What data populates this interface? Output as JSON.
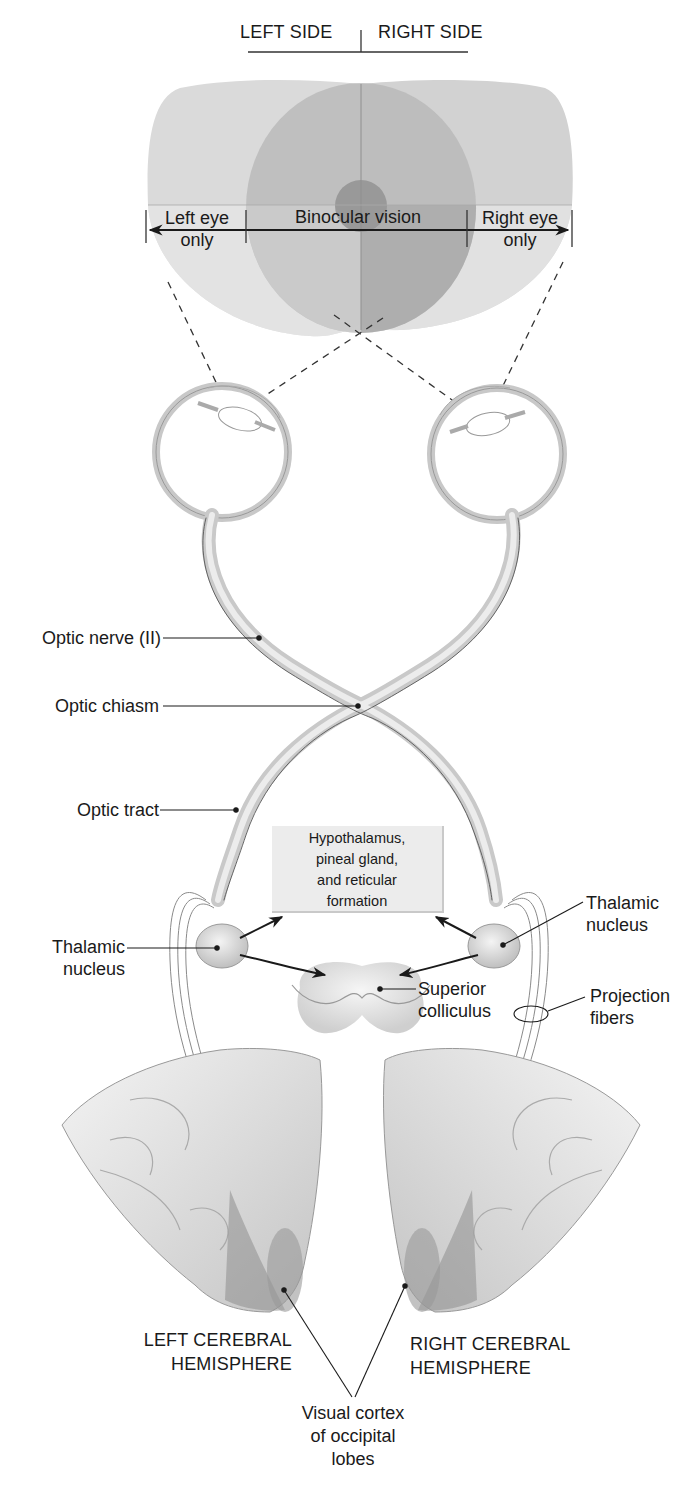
{
  "figure": {
    "type": "anatomical-diagram"
  },
  "header": {
    "left_side": "LEFT SIDE",
    "right_side": "RIGHT SIDE"
  },
  "visual_field": {
    "left_eye_only": [
      "Left eye",
      "only"
    ],
    "binocular": "Binocular vision",
    "right_eye_only": [
      "Right eye",
      "only"
    ]
  },
  "labels": {
    "optic_nerve": "Optic nerve (II)",
    "optic_chiasm": "Optic chiasm",
    "optic_tract": "Optic tract",
    "hypothalamus_box": [
      "Hypothalamus,",
      "pineal gland,",
      "and reticular",
      "formation"
    ],
    "thalamic_nucleus_left": [
      "Thalamic",
      "nucleus"
    ],
    "thalamic_nucleus_right": [
      "Thalamic",
      "nucleus"
    ],
    "superior_colliculus": [
      "Superior",
      "colliculus"
    ],
    "projection_fibers": [
      "Projection",
      "fibers"
    ],
    "left_hemisphere": [
      "LEFT CEREBRAL",
      "HEMISPHERE"
    ],
    "right_hemisphere": [
      "RIGHT CEREBRAL",
      "HEMISPHERE"
    ],
    "visual_cortex": [
      "Visual cortex",
      "of occipital",
      "lobes"
    ]
  },
  "colors": {
    "field_light": "#d9d9d9",
    "field_mid": "#bdbdbd",
    "field_dark": "#a3a3a3",
    "band": "#e6e6e6",
    "nerve": "#cfcfcf",
    "line": "#1a1a1a"
  }
}
